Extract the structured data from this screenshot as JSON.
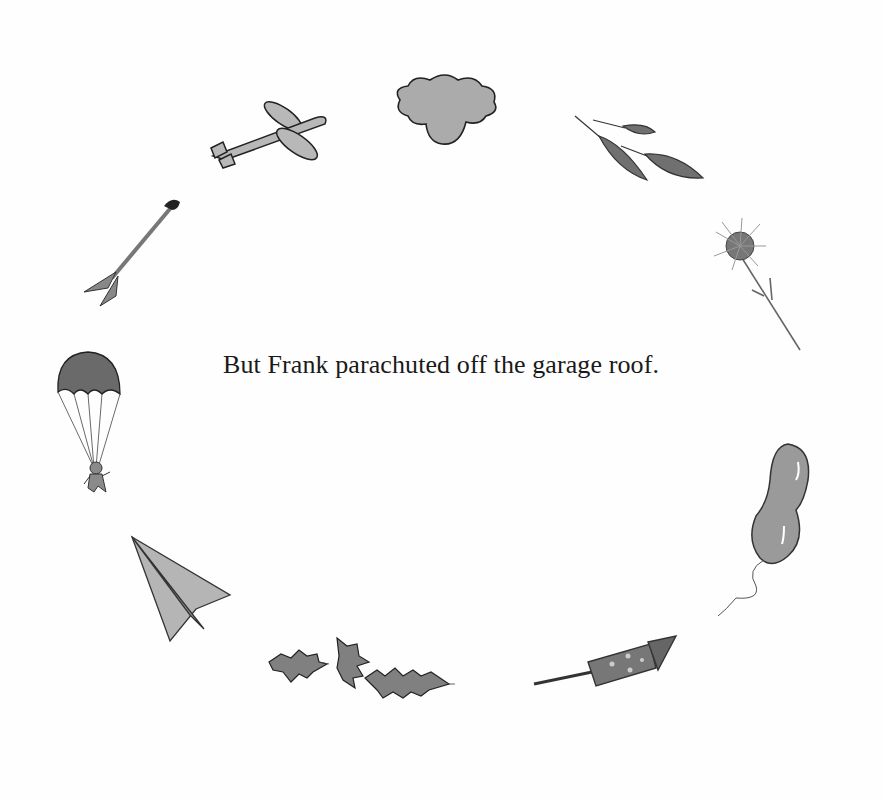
{
  "page": {
    "caption": "But Frank parachuted off the garage roof.",
    "illustrations": [
      {
        "name": "airplane",
        "position": "top-left"
      },
      {
        "name": "cloud",
        "position": "top-center"
      },
      {
        "name": "leaves",
        "position": "top-right"
      },
      {
        "name": "dandelion",
        "position": "right-upper"
      },
      {
        "name": "balloon",
        "position": "right-lower"
      },
      {
        "name": "rocket",
        "position": "bottom-right"
      },
      {
        "name": "holly-leaves",
        "position": "bottom-center"
      },
      {
        "name": "paper-airplane",
        "position": "bottom-left"
      },
      {
        "name": "parachute-figure",
        "position": "left-center"
      },
      {
        "name": "arrow",
        "position": "left-upper"
      }
    ]
  },
  "colors": {
    "background": "#fefefe",
    "ink": "#1a1a1a",
    "gray_fill": "#a8a8a8",
    "dark_fill": "#6e6e6e"
  }
}
